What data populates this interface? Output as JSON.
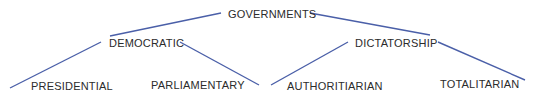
{
  "diagram": {
    "type": "tree",
    "line_color": "#4a5fa8",
    "text_color": "#2b2b2b",
    "root": {
      "label": "GOVERNMENTS",
      "children": [
        {
          "label": "DEMOCRATIC",
          "children": [
            {
              "label": "PRESIDENTIAL"
            },
            {
              "label": "PARLIAMENTARY"
            }
          ]
        },
        {
          "label": "DICTATORSHIP",
          "children": [
            {
              "label": "AUTHORITIARIAN"
            },
            {
              "label": "TOTALITARIAN"
            }
          ]
        }
      ]
    }
  }
}
